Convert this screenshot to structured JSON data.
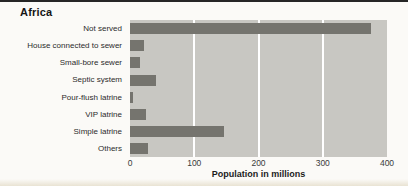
{
  "title": "Africa",
  "chart_data": {
    "type": "bar",
    "orientation": "horizontal",
    "title": "Africa",
    "categories": [
      "Not served",
      "House connected to sewer",
      "Small-bore sewer",
      "Septic system",
      "Pour-flush latrine",
      "VIP latrine",
      "Simple latrine",
      "Others"
    ],
    "values": [
      375,
      22,
      15,
      40,
      5,
      25,
      147,
      28
    ],
    "xlabel": "Population in millions",
    "xlim": [
      0,
      400
    ],
    "xticks": [
      0,
      100,
      200,
      300,
      400
    ],
    "gridlines": [
      100,
      200,
      300
    ],
    "grid_on": true,
    "legend": "none",
    "bar_color": "#75746e",
    "plot_bg": "#c8c7c2",
    "grid_color": "#ffffff",
    "page_bg": "#fbfaf7",
    "top_rule_color": "#262626",
    "bottom_strip_color": "#e9e3d3"
  }
}
